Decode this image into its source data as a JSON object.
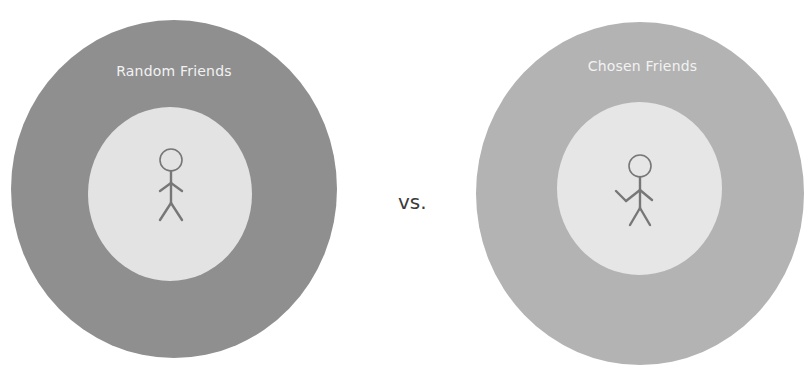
{
  "diagram": {
    "left": {
      "title": "Random Friends",
      "figure_pose": "standing-arms-down",
      "outer_color": "#8f8f8f",
      "inner_color": "#e3e3e3"
    },
    "separator": "vs.",
    "right": {
      "title": "Chosen Friends",
      "figure_pose": "waving",
      "outer_color": "#b3b3b3",
      "inner_color": "#e6e6e6"
    },
    "label_color": "#f2f2f2",
    "figure_stroke": "#777777",
    "icons": [
      "stick-figure-icon",
      "stick-figure-waving-icon"
    ]
  }
}
